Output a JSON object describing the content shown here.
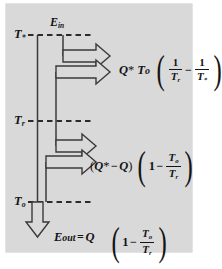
{
  "figure": {
    "background_color": "#d9d9d9",
    "line_color": "#2b2b2b",
    "axis_labels": {
      "top": {
        "symbol": "T",
        "subscript": "*",
        "full": "T*"
      },
      "middle": {
        "symbol": "T",
        "subscript": "r",
        "full": "Tr"
      },
      "bottom": {
        "symbol": "T",
        "subscript": "o",
        "full": "To"
      }
    },
    "input_label": {
      "symbol": "E",
      "subscript": "in",
      "full": "Ein"
    },
    "output_label": {
      "symbol": "E",
      "subscript": "out",
      "full": "Eout"
    },
    "equals": "=",
    "minus": "−",
    "one": "1",
    "paren_open": "(",
    "paren_close": ")",
    "terms": {
      "q_star": "Q",
      "q_star_sup": "*",
      "q": "Q",
      "t0": "T",
      "t0_sub": "o",
      "tr": "T",
      "tr_sub": "r",
      "tstar": "T",
      "tstar_sub": "*"
    },
    "formulas": [
      {
        "id": "exergy-destruction-upper",
        "text": "Q* T₀ (1/Tᵣ − 1/T*)"
      },
      {
        "id": "exergy-destruction-middle",
        "text": "(Q* − Q)(1 − T₀/Tᵣ)"
      },
      {
        "id": "exergy-out",
        "text": "E_out = Q (1 − T₀/Tᵣ)"
      }
    ]
  }
}
